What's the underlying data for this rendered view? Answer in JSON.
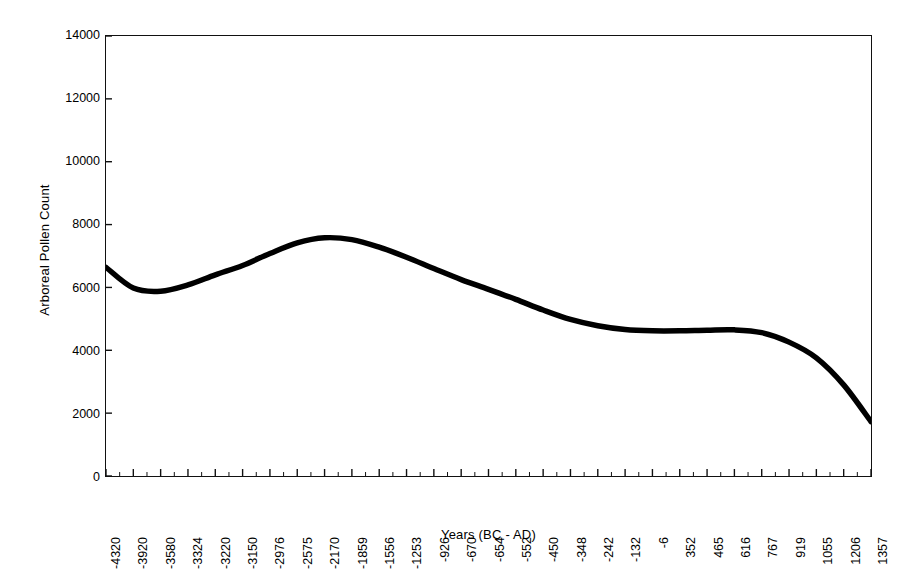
{
  "chart_data": {
    "type": "line",
    "title": "",
    "xlabel": "Years (BC - AD)",
    "ylabel": "Arboreal Pollen Count",
    "ylim": [
      0,
      14000
    ],
    "y_ticks": [
      0,
      2000,
      4000,
      6000,
      8000,
      10000,
      12000,
      14000
    ],
    "y_tick_labels": [
      "0",
      "2000",
      "4000",
      "6000",
      "8000",
      "10000",
      "12000",
      "14000"
    ],
    "grid": false,
    "legend": false,
    "legend_position": "none",
    "line_color": "#000000",
    "background_color": "#ffffff",
    "axis_color": "#111111",
    "categories": [
      "-4320",
      "-3920",
      "-3580",
      "-3324",
      "-3220",
      "-3150",
      "-2976",
      "-2575",
      "-2170",
      "-1859",
      "-1556",
      "-1253",
      "-926",
      "-670",
      "-654",
      "-552",
      "-450",
      "-348",
      "-242",
      "-132",
      "-6",
      "352",
      "465",
      "616",
      "767",
      "919",
      "1055",
      "1206",
      "1357"
    ],
    "series": [
      {
        "name": "Arboreal Pollen Count",
        "values": [
          6640,
          5980,
          5880,
          6080,
          6400,
          6700,
          7080,
          7420,
          7580,
          7520,
          7280,
          6960,
          6600,
          6250,
          5940,
          5620,
          5280,
          4980,
          4780,
          4660,
          4620,
          4620,
          4640,
          4650,
          4560,
          4260,
          3760,
          2900,
          1730
        ]
      }
    ],
    "notes": {
      "minimum_value": 5880,
      "minimum_at": "-3580",
      "peak_value": 7580,
      "peak_at": "-2170",
      "plateau_value": 4620,
      "plateau_range": [
        "-132",
        "616"
      ],
      "final_value": 1730,
      "final_at": "1357",
      "start_value": 6640,
      "start_at": "-4320"
    }
  }
}
